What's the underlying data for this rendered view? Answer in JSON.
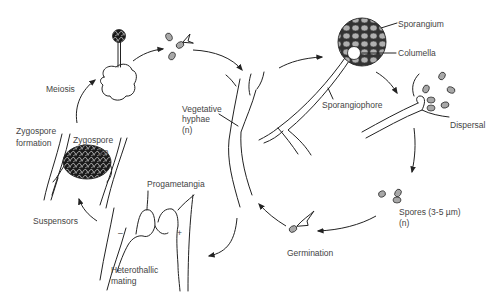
{
  "diagram": {
    "type": "life-cycle",
    "colors": {
      "line": "#222222",
      "label": "#444444",
      "spore_fill": "#a8a8a8",
      "zygospore_fill": "#222222",
      "background": "#ffffff"
    },
    "labels": {
      "meiosis": "Meiosis",
      "zygospore_formation_1": "Zygospore",
      "zygospore_formation_2": "formation",
      "zygospore": "Zygospore",
      "ploidy_2n": "2n",
      "suspensors": "Suspensors",
      "progametangia": "Progametangia",
      "minus": "–",
      "plus": "+",
      "heterothallic_1": "Heterothallic",
      "heterothallic_2": "mating",
      "vegetative_1": "Vegetative",
      "vegetative_2": "hyphae",
      "vegetative_3": "(n)",
      "sporangium": "Sporangium",
      "columella": "Columella",
      "sporangiophore": "Sporangiophore",
      "dispersal": "Dispersal",
      "spores_1": "Spores (3-5 µm)",
      "spores_2": "(n)",
      "germination": "Germination"
    },
    "stages": [
      "Vegetative hyphae (n)",
      "Sporangium",
      "Dispersal",
      "Spores (3-5 µm) (n)",
      "Germination",
      "Heterothallic mating",
      "Zygospore formation",
      "Meiosis"
    ]
  }
}
